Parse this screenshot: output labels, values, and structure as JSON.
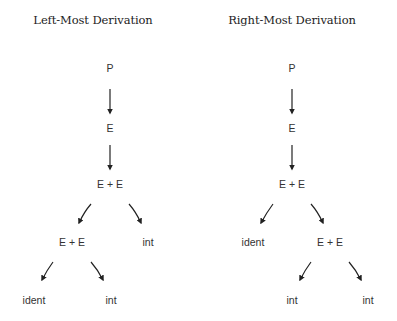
{
  "left": {
    "title": "Left-Most Derivation",
    "nodes": {
      "p": "P",
      "e": "E",
      "e_plus_e_1": "E  +  E",
      "e_plus_e_2": "E  +  E",
      "int_1": "int",
      "ident": "ident",
      "int_2": "int"
    }
  },
  "right": {
    "title": "Right-Most Derivation",
    "nodes": {
      "p": "P",
      "e": "E",
      "e_plus_e_1": "E + E",
      "ident": "ident",
      "e_plus_e_2": "E + E",
      "int_1": "int",
      "int_2": "int"
    }
  },
  "colors": {
    "arrow": "#222222",
    "text": "#333333",
    "title": "#222222",
    "background": "#ffffff"
  }
}
